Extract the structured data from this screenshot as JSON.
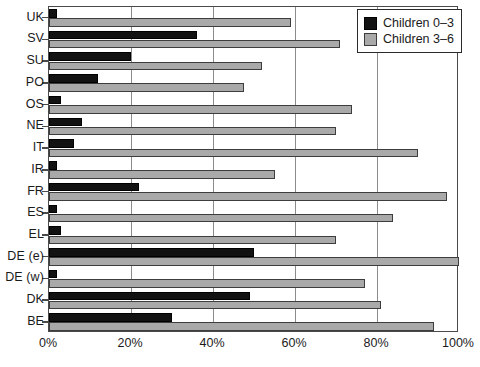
{
  "chart_data": {
    "type": "bar",
    "orientation": "horizontal",
    "title": "",
    "xlabel": "",
    "ylabel": "",
    "xlim": [
      0,
      100
    ],
    "xticks": [
      0,
      20,
      40,
      60,
      80,
      100
    ],
    "xtick_labels": [
      "0%",
      "20%",
      "40%",
      "60%",
      "80%",
      "100%"
    ],
    "grid": "vertical",
    "legend_position": "top-right",
    "categories": [
      "UK",
      "SV",
      "SU",
      "PO",
      "OS",
      "NE",
      "IT",
      "IR",
      "FR",
      "ES",
      "EL",
      "DE (e)",
      "DE (w)",
      "DK",
      "BE"
    ],
    "series": [
      {
        "name": "Children 0–3",
        "color": "#121212",
        "values": [
          2,
          36,
          20,
          12,
          3,
          8,
          6,
          2,
          22,
          2,
          3,
          50,
          2,
          49,
          30
        ]
      },
      {
        "name": "Children 3–6",
        "color": "#a9a9a9",
        "values": [
          59,
          71,
          52,
          47.5,
          74,
          70,
          90,
          55,
          97,
          84,
          70,
          100,
          77,
          81,
          94
        ]
      }
    ]
  },
  "legend": {
    "items": [
      {
        "label": "Children 0–3",
        "swatch": "black"
      },
      {
        "label": "Children 3–6",
        "swatch": "gray"
      }
    ]
  }
}
